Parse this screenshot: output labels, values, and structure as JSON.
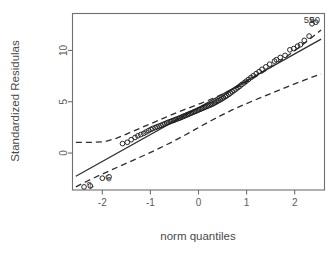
{
  "chart_data": {
    "type": "scatter",
    "title": "",
    "subtitle": "",
    "xlabel": "norm quantiles",
    "ylabel": "Standardized Residulas",
    "xlim": [
      -2.62,
      2.62
    ],
    "ylim": [
      -3.6,
      13.6
    ],
    "xticks": [
      -2,
      -1,
      0,
      1,
      2
    ],
    "xticklabels": [
      "-2",
      "-1",
      "0",
      "1",
      "2"
    ],
    "yticks": [
      0,
      5,
      10
    ],
    "yticklabels": [
      "0",
      "5",
      "10"
    ],
    "grid": false,
    "legend": null,
    "legend_position": "none",
    "marker": "open-circle",
    "reference_line": {
      "style": "solid",
      "slope": 2.62,
      "intercept": 4.42,
      "x_start": -2.55,
      "x_end": 2.55,
      "y_start": -2.26,
      "y_end": 11.1
    },
    "confidence_envelope": {
      "style": "dashed",
      "description": "pointwise confidence band, widest at the distribution extremes",
      "upper": [
        [
          -2.55,
          1.05
        ],
        [
          -2.2,
          1.05
        ],
        [
          -1.95,
          1.1
        ],
        [
          -1.7,
          1.45
        ],
        [
          -1.45,
          1.95
        ],
        [
          -1.2,
          2.45
        ],
        [
          -0.95,
          2.95
        ],
        [
          -0.7,
          3.45
        ],
        [
          -0.45,
          3.95
        ],
        [
          -0.2,
          4.4
        ],
        [
          0.05,
          4.85
        ],
        [
          0.3,
          5.32
        ],
        [
          0.55,
          5.85
        ],
        [
          0.8,
          6.42
        ],
        [
          1.05,
          7.05
        ],
        [
          1.3,
          7.75
        ],
        [
          1.55,
          8.5
        ],
        [
          1.8,
          9.3
        ],
        [
          2.05,
          10.15
        ],
        [
          2.3,
          11.05
        ],
        [
          2.55,
          12.0
        ]
      ],
      "lower": [
        [
          -2.55,
          -3.3
        ],
        [
          -2.3,
          -2.7
        ],
        [
          -2.05,
          -2.15
        ],
        [
          -1.8,
          -1.62
        ],
        [
          -1.55,
          -1.1
        ],
        [
          -1.3,
          -0.58
        ],
        [
          -1.05,
          -0.05
        ],
        [
          -0.8,
          0.5
        ],
        [
          -0.55,
          1.08
        ],
        [
          -0.3,
          1.7
        ],
        [
          -0.05,
          2.35
        ],
        [
          0.2,
          3.0
        ],
        [
          0.45,
          3.62
        ],
        [
          0.7,
          4.2
        ],
        [
          0.95,
          4.72
        ],
        [
          1.2,
          5.22
        ],
        [
          1.45,
          5.7
        ],
        [
          1.7,
          6.18
        ],
        [
          1.95,
          6.65
        ],
        [
          2.2,
          7.1
        ],
        [
          2.45,
          7.55
        ],
        [
          2.55,
          7.7
        ]
      ]
    },
    "point_labels": [
      {
        "text": "59",
        "x": 2.3,
        "y": 13.05,
        "rotation": 0
      },
      {
        "text": "50",
        "x": 2.42,
        "y": 13.05,
        "rotation": 0
      },
      {
        "text": "2",
        "x": -2.26,
        "y": -3.1,
        "rotation": 36
      },
      {
        "text": "6",
        "x": -1.88,
        "y": -2.45,
        "rotation": 36
      }
    ],
    "points": [
      [
        -2.38,
        -3.3
      ],
      [
        -2.25,
        -3.2
      ],
      [
        -2.0,
        -2.45
      ],
      [
        -1.86,
        -2.32
      ],
      [
        -1.58,
        0.92
      ],
      [
        -1.48,
        1.05
      ],
      [
        -1.4,
        1.3
      ],
      [
        -1.32,
        1.52
      ],
      [
        -1.26,
        1.68
      ],
      [
        -1.2,
        1.8
      ],
      [
        -1.14,
        1.92
      ],
      [
        -1.09,
        2.05
      ],
      [
        -1.04,
        2.18
      ],
      [
        -0.99,
        2.3
      ],
      [
        -0.95,
        2.4
      ],
      [
        -0.9,
        2.48
      ],
      [
        -0.86,
        2.56
      ],
      [
        -0.82,
        2.63
      ],
      [
        -0.78,
        2.7
      ],
      [
        -0.74,
        2.78
      ],
      [
        -0.7,
        2.86
      ],
      [
        -0.66,
        2.93
      ],
      [
        -0.63,
        3.0
      ],
      [
        -0.59,
        3.06
      ],
      [
        -0.56,
        3.12
      ],
      [
        -0.52,
        3.18
      ],
      [
        -0.49,
        3.24
      ],
      [
        -0.46,
        3.3
      ],
      [
        -0.42,
        3.36
      ],
      [
        -0.39,
        3.42
      ],
      [
        -0.36,
        3.48
      ],
      [
        -0.33,
        3.54
      ],
      [
        -0.3,
        3.6
      ],
      [
        -0.27,
        3.66
      ],
      [
        -0.24,
        3.72
      ],
      [
        -0.21,
        3.78
      ],
      [
        -0.18,
        3.84
      ],
      [
        -0.15,
        3.9
      ],
      [
        -0.12,
        3.96
      ],
      [
        -0.09,
        4.02
      ],
      [
        -0.06,
        4.08
      ],
      [
        -0.03,
        4.14
      ],
      [
        0.0,
        4.2
      ],
      [
        0.03,
        4.26
      ],
      [
        0.06,
        4.32
      ],
      [
        0.09,
        4.38
      ],
      [
        0.12,
        4.44
      ],
      [
        0.15,
        4.5
      ],
      [
        0.18,
        4.56
      ],
      [
        0.21,
        4.62
      ],
      [
        0.24,
        4.68
      ],
      [
        0.27,
        4.74
      ],
      [
        0.3,
        4.8
      ],
      [
        0.33,
        4.88
      ],
      [
        0.36,
        4.96
      ],
      [
        0.39,
        5.04
      ],
      [
        0.42,
        5.12
      ],
      [
        0.46,
        5.2
      ],
      [
        0.49,
        5.3
      ],
      [
        0.52,
        5.4
      ],
      [
        0.56,
        5.5
      ],
      [
        0.59,
        5.6
      ],
      [
        0.63,
        5.72
      ],
      [
        0.66,
        5.84
      ],
      [
        0.7,
        5.96
      ],
      [
        0.74,
        6.1
      ],
      [
        0.78,
        6.24
      ],
      [
        0.82,
        6.38
      ],
      [
        0.86,
        6.52
      ],
      [
        0.9,
        6.68
      ],
      [
        0.95,
        6.84
      ],
      [
        0.99,
        7.0
      ],
      [
        1.04,
        7.18
      ],
      [
        1.09,
        7.36
      ],
      [
        1.14,
        7.54
      ],
      [
        1.2,
        7.74
      ],
      [
        1.26,
        7.94
      ],
      [
        1.32,
        8.16
      ],
      [
        1.4,
        8.4
      ],
      [
        1.48,
        8.66
      ],
      [
        1.58,
        8.96
      ],
      [
        1.62,
        9.1
      ],
      [
        1.7,
        9.32
      ],
      [
        1.8,
        9.52
      ],
      [
        1.9,
        10.06
      ],
      [
        1.98,
        10.18
      ],
      [
        2.06,
        10.42
      ],
      [
        2.12,
        10.56
      ],
      [
        2.2,
        10.98
      ],
      [
        2.3,
        11.4
      ],
      [
        2.36,
        12.6
      ],
      [
        2.44,
        12.75
      ]
    ]
  }
}
